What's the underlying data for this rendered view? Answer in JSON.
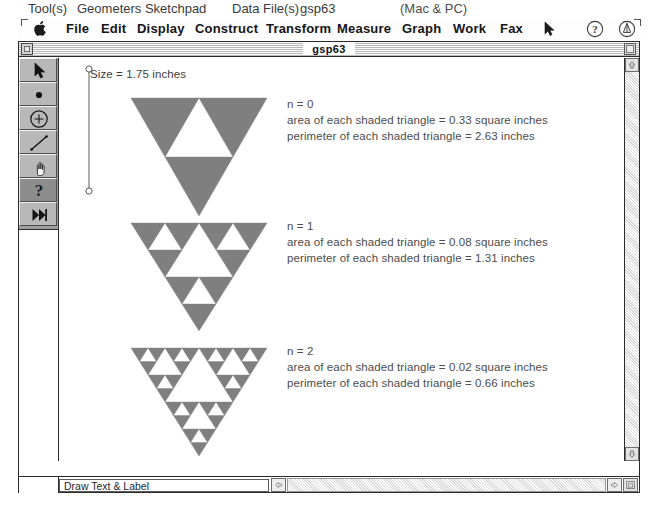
{
  "caption": {
    "tools_label": "Tool(s)",
    "app_name": "Geometers Sketchpad",
    "datafile_label": "Data File(s)",
    "datafile_name": "gsp63",
    "platform": "(Mac & PC)"
  },
  "menu": {
    "items": [
      "File",
      "Edit",
      "Display",
      "Construct",
      "Transform",
      "Measure",
      "Graph",
      "Work",
      "Fax"
    ],
    "apple_icon": "apple-icon",
    "cursor_icon": "cursor-icon",
    "help_icon": "help-question-icon",
    "badge_icon": "gsp-badge-icon"
  },
  "window": {
    "title": "gsp63",
    "close_icon": "close-box-icon",
    "zoom_icon": "zoom-box-icon"
  },
  "tools": [
    {
      "name": "selection-arrow-tool",
      "icon": "arrow-icon",
      "active": false
    },
    {
      "name": "point-tool",
      "icon": "point-dot-icon",
      "active": false
    },
    {
      "name": "compass-circle-tool",
      "icon": "circle-plus-icon",
      "active": false
    },
    {
      "name": "straightedge-tool",
      "icon": "line-segment-icon",
      "active": false
    },
    {
      "name": "hand-script-tool",
      "icon": "hand-icon",
      "active": false
    },
    {
      "name": "text-label-tool",
      "icon": "question-mark-icon",
      "active": true
    },
    {
      "name": "custom-tool",
      "icon": "fast-forward-icon",
      "active": false
    }
  ],
  "canvas": {
    "size_measurement": "Size = 1.75 inches",
    "figures": [
      {
        "n_label": "n = 0",
        "area_text": "area of each shaded triangle = 0.33 square inches",
        "perimeter_text": "perimeter of each shaded triangle = 2.63 inches",
        "depth": 1,
        "shaded_count": 3,
        "area_value": 0.33,
        "perimeter_value": 2.63
      },
      {
        "n_label": "n = 1",
        "area_text": "area of each shaded triangle = 0.08 square inches",
        "perimeter_text": "perimeter of each shaded triangle = 1.31 inches",
        "depth": 2,
        "shaded_count": 9,
        "area_value": 0.08,
        "perimeter_value": 1.31
      },
      {
        "n_label": "n = 2",
        "area_text": "area of each shaded triangle = 0.02 square inches",
        "perimeter_text": "perimeter of each shaded triangle = 0.66 inches",
        "depth": 3,
        "shaded_count": 27,
        "area_value": 0.02,
        "perimeter_value": 0.66
      }
    ],
    "triangle_fill": "#7f7f7f"
  },
  "status": {
    "message": "Draw Text & Label"
  },
  "scrollbars": {
    "up_arrow_icon": "scroll-up-arrow-icon",
    "down_arrow_icon": "scroll-down-arrow-icon",
    "left_arrow_icon": "scroll-left-arrow-icon",
    "right_arrow_icon": "scroll-right-arrow-icon",
    "resize_grip_icon": "resize-grip-icon"
  }
}
